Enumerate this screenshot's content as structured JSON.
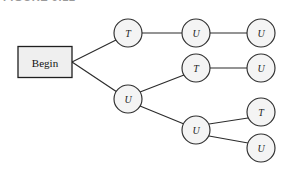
{
  "figure": {
    "caption": "FIGURE 9.12",
    "background_color": "#ffffff"
  },
  "diagram": {
    "type": "tree",
    "title": "",
    "start_node": {
      "label": "Begin",
      "shape": "rectangle",
      "fill_color": "#efefef",
      "border_color": "#1f1f1f",
      "x": 45,
      "y": 62,
      "width": 54,
      "height": 31
    },
    "node_style": {
      "shape": "circle",
      "radius": 14,
      "fill_color": "#f4f4f4",
      "border_color": "#2f2f2f",
      "text_color": "#1c1c1c"
    },
    "edge_style": {
      "color": "#2b2b2b",
      "width": 1.15
    },
    "nodes": [
      {
        "id": "n1",
        "label": "T",
        "x": 128,
        "y": 33
      },
      {
        "id": "n2",
        "label": "U",
        "x": 196,
        "y": 33
      },
      {
        "id": "n3",
        "label": "U",
        "x": 261,
        "y": 33
      },
      {
        "id": "n4",
        "label": "U",
        "x": 128,
        "y": 99
      },
      {
        "id": "n5",
        "label": "T",
        "x": 196,
        "y": 68
      },
      {
        "id": "n6",
        "label": "U",
        "x": 261,
        "y": 68
      },
      {
        "id": "n7",
        "label": "U",
        "x": 196,
        "y": 130
      },
      {
        "id": "n8",
        "label": "T",
        "x": 261,
        "y": 112
      },
      {
        "id": "n9",
        "label": "U",
        "x": 261,
        "y": 148
      }
    ],
    "edges": [
      {
        "from": "begin",
        "to": "n1"
      },
      {
        "from": "begin",
        "to": "n4"
      },
      {
        "from": "n1",
        "to": "n2"
      },
      {
        "from": "n2",
        "to": "n3"
      },
      {
        "from": "n4",
        "to": "n5"
      },
      {
        "from": "n5",
        "to": "n6"
      },
      {
        "from": "n4",
        "to": "n7"
      },
      {
        "from": "n7",
        "to": "n8"
      },
      {
        "from": "n7",
        "to": "n9"
      }
    ]
  }
}
